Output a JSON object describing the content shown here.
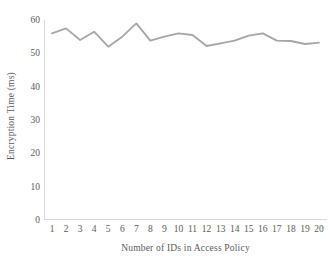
{
  "chart_data": {
    "type": "line",
    "title": "",
    "xlabel": "Number of IDs in Access Policy",
    "ylabel": "Encryption Time (ms)",
    "categories": [
      "1",
      "2",
      "3",
      "4",
      "5",
      "6",
      "7",
      "8",
      "9",
      "10",
      "11",
      "12",
      "13",
      "14",
      "15",
      "16",
      "17",
      "18",
      "19",
      "20"
    ],
    "x": [
      1,
      2,
      3,
      4,
      5,
      6,
      7,
      8,
      9,
      10,
      11,
      12,
      13,
      14,
      15,
      16,
      17,
      18,
      19,
      20
    ],
    "values": [
      56.0,
      57.5,
      54.0,
      56.5,
      52.0,
      55.0,
      59.0,
      53.8,
      55.0,
      56.0,
      55.5,
      52.2,
      53.0,
      53.8,
      55.3,
      56.0,
      53.8,
      53.7,
      52.8,
      53.2
    ],
    "series": [
      {
        "name": "Encryption Time",
        "color": "#A6A6A6",
        "values": [
          56.0,
          57.5,
          54.0,
          56.5,
          52.0,
          55.0,
          59.0,
          53.8,
          55.0,
          56.0,
          55.5,
          52.2,
          53.0,
          53.8,
          55.3,
          56.0,
          53.8,
          53.7,
          52.8,
          53.2
        ]
      }
    ],
    "ylim": [
      0,
      60
    ],
    "xlim": [
      1,
      20
    ],
    "y_ticks": [
      "0",
      "10",
      "20",
      "30",
      "40",
      "50",
      "60"
    ],
    "y_tick_values": [
      0,
      10,
      20,
      30,
      40,
      50,
      60
    ],
    "grid": false,
    "legend": "none",
    "markers": false,
    "line_color": "#A6A6A6",
    "axis_color": "#D9D9D9",
    "text_color": "#5A5A5A",
    "background": "#FFFFFF"
  }
}
